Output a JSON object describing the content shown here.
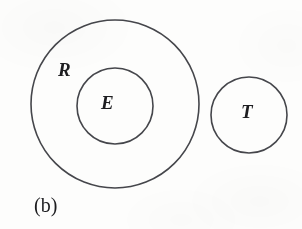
{
  "figure": {
    "caption": "(b)",
    "background_color": "#fdfdfc",
    "stroke_color": "#45464b",
    "label_color": "#1d1d20",
    "width": 302,
    "height": 229
  },
  "chart_data": {
    "type": "diagram",
    "subtype": "venn-euler-set-diagram",
    "title": "",
    "caption": "(b)",
    "sets": [
      {
        "id": "R",
        "label": "R",
        "shape": "circle",
        "cx": 115,
        "cy": 104,
        "r": 84,
        "stroke": "#45464b",
        "stroke_width": 1.6,
        "fill": "none",
        "label_x": 67,
        "label_y": 71
      },
      {
        "id": "E",
        "label": "E",
        "shape": "circle",
        "cx": 115,
        "cy": 106,
        "r": 38,
        "stroke": "#45464b",
        "stroke_width": 1.6,
        "fill": "none",
        "label_x": 110,
        "label_y": 104
      },
      {
        "id": "T",
        "label": "T",
        "shape": "circle",
        "cx": 249,
        "cy": 115,
        "r": 38,
        "stroke": "#45464b",
        "stroke_width": 1.6,
        "fill": "none",
        "label_x": 250,
        "label_y": 113
      }
    ],
    "relations": [
      {
        "subset": "E",
        "superset": "R",
        "type": "proper-subset"
      },
      {
        "a": "T",
        "b": "R",
        "type": "disjoint"
      },
      {
        "a": "T",
        "b": "E",
        "type": "disjoint"
      }
    ]
  }
}
